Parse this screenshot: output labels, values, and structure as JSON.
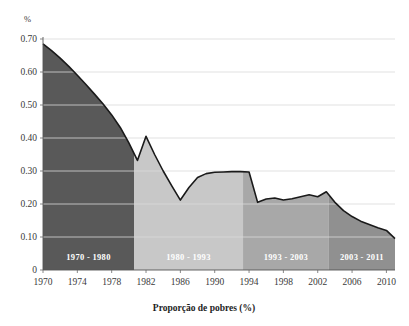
{
  "chart_data": {
    "type": "area",
    "title": "",
    "xlabel": "Proporção de pobres (%)",
    "ylabel": "%",
    "unit_label": "%",
    "xlim": [
      1970,
      2011
    ],
    "ylim": [
      0,
      0.7
    ],
    "grid": true,
    "legend": "none",
    "y_ticks": [
      "0.70",
      "0.60",
      "0.50",
      "0.40",
      "0.30",
      "0.20",
      "0.10",
      "0"
    ],
    "y_tick_values": [
      0.7,
      0.6,
      0.5,
      0.4,
      0.3,
      0.2,
      0.1,
      0
    ],
    "x_ticks": [
      "1970",
      "1974",
      "1978",
      "1982",
      "1986",
      "1990",
      "1994",
      "1998",
      "2002",
      "2006",
      "2010"
    ],
    "x_tick_values": [
      1970,
      1974,
      1978,
      1982,
      1986,
      1990,
      1994,
      1998,
      2002,
      2006,
      2010
    ],
    "series": [
      {
        "name": "Proporção de pobres",
        "x": [
          1970,
          1971,
          1972,
          1973,
          1974,
          1975,
          1976,
          1977,
          1978,
          1979,
          1980,
          1981,
          1982,
          1983,
          1984,
          1985,
          1986,
          1987,
          1988,
          1989,
          1990,
          1991,
          1992,
          1993,
          1994,
          1995,
          1996,
          1997,
          1998,
          1999,
          2000,
          2001,
          2002,
          2003,
          2004,
          2005,
          2006,
          2007,
          2008,
          2009,
          2010,
          2011
        ],
        "values": [
          0.685,
          0.665,
          0.642,
          0.617,
          0.59,
          0.562,
          0.533,
          0.503,
          0.47,
          0.432,
          0.385,
          0.332,
          0.405,
          0.35,
          0.3,
          0.255,
          0.212,
          0.25,
          0.28,
          0.292,
          0.296,
          0.297,
          0.298,
          0.298,
          0.297,
          0.205,
          0.215,
          0.218,
          0.212,
          0.216,
          0.222,
          0.228,
          0.222,
          0.237,
          0.205,
          0.18,
          0.162,
          0.148,
          0.138,
          0.128,
          0.12,
          0.095
        ]
      }
    ],
    "bands": [
      {
        "label": "1970 - 1980",
        "start": 1970,
        "end": 1980.6,
        "color": "#595959"
      },
      {
        "label": "1980 - 1993",
        "start": 1980.6,
        "end": 1993.3,
        "color": "#c8c8c8"
      },
      {
        "label": "1993 - 2003",
        "start": 1993.3,
        "end": 2003.3,
        "color": "#a8a8a8"
      },
      {
        "label": "2003 - 2011",
        "start": 2003.3,
        "end": 2011.0,
        "color": "#909090"
      }
    ],
    "curve_color": "#1a1a1a",
    "grid_color": "#d9d9d9",
    "axis_color": "#555555"
  }
}
